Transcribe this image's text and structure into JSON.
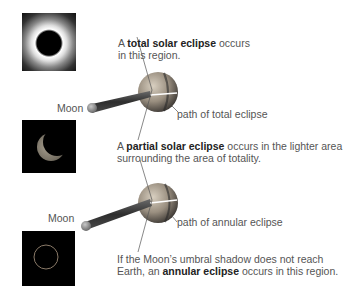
{
  "photos": {
    "total": {
      "label": "total-eclipse-photo"
    },
    "partial": {
      "label": "partial-eclipse-photo"
    },
    "annular": {
      "label": "annular-eclipse-photo"
    }
  },
  "top_panel": {
    "caption_pre": "A ",
    "caption_bold": "total solar eclipse",
    "caption_post": " occurs",
    "caption_line2": "in this region.",
    "moon_label": "Moon",
    "path_label": "path of total eclipse"
  },
  "middle_caption": {
    "pre": "A ",
    "bold": "partial solar eclipse",
    "post": " occurs in the lighter area",
    "line2": "surrounding the area of totality."
  },
  "bottom_panel": {
    "moon_label": "Moon",
    "path_label": "path of annular eclipse",
    "caption_line1": "If the Moon’s umbral shadow does not reach",
    "caption_pre": "Earth, an ",
    "caption_bold": "annular eclipse",
    "caption_post": " occurs in this region."
  },
  "colors": {
    "earth": "#9a8f80",
    "shadow_cone": "#3a3a3a",
    "moon": "#8a8a8a",
    "text": "#555555",
    "bold_text": "#222222"
  }
}
